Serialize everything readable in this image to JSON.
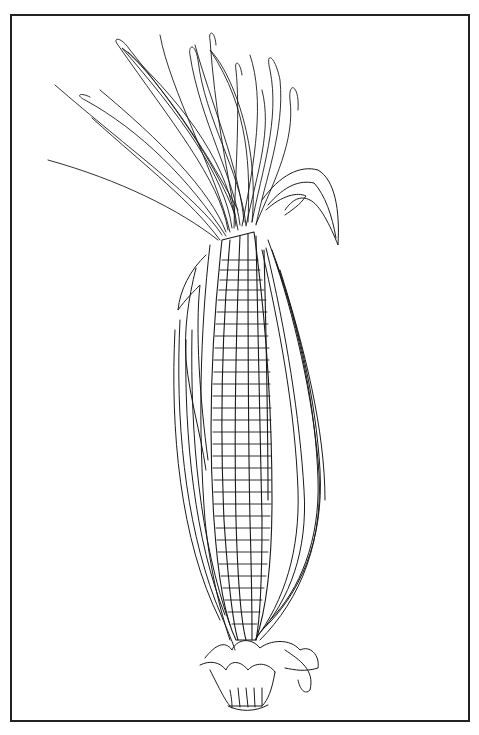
{
  "illustration": {
    "subject": "ear of corn with husk and silk",
    "style": "black ink line drawing",
    "colors": {
      "ink": "#1a1a1a",
      "paper": "#ffffff",
      "border": "#222222"
    }
  }
}
